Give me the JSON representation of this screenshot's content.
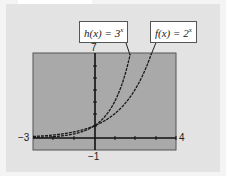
{
  "chart_data": {
    "type": "line",
    "title": "",
    "xlabel": "",
    "ylabel": "",
    "xlim": [
      -3,
      4
    ],
    "ylim": [
      -1,
      7
    ],
    "grid": false,
    "series": [
      {
        "name": "h(x) = 3^x",
        "function": "3^x",
        "x": [
          -3,
          -2,
          -1,
          0,
          1,
          1.5,
          1.77
        ],
        "values": [
          0.037,
          0.111,
          0.333,
          1,
          3,
          5.196,
          7
        ]
      },
      {
        "name": "f(x) = 2^x",
        "function": "2^x",
        "x": [
          -3,
          -2,
          -1,
          0,
          1,
          2,
          2.81
        ],
        "values": [
          0.125,
          0.25,
          0.5,
          1,
          2,
          4,
          7
        ]
      }
    ],
    "tick_labels": {
      "x_min": "−3",
      "x_max": "4",
      "y_max": "7",
      "y_min": "−1"
    },
    "annotations": [
      "h(x) = 3^x",
      "f(x) = 2^x"
    ]
  },
  "labels": {
    "h_name": "h(x) = 3",
    "h_exp": "x",
    "f_name": "f(x) = 2",
    "f_exp": "x"
  },
  "ticks": {
    "xmin": "−3",
    "xmax": "4",
    "ymax": "7",
    "ymin": "−1"
  },
  "colors": {
    "plot_bg": "#a8a8a8",
    "panel_bg": "#e3e3e3",
    "curve": "#1a1a1a"
  }
}
